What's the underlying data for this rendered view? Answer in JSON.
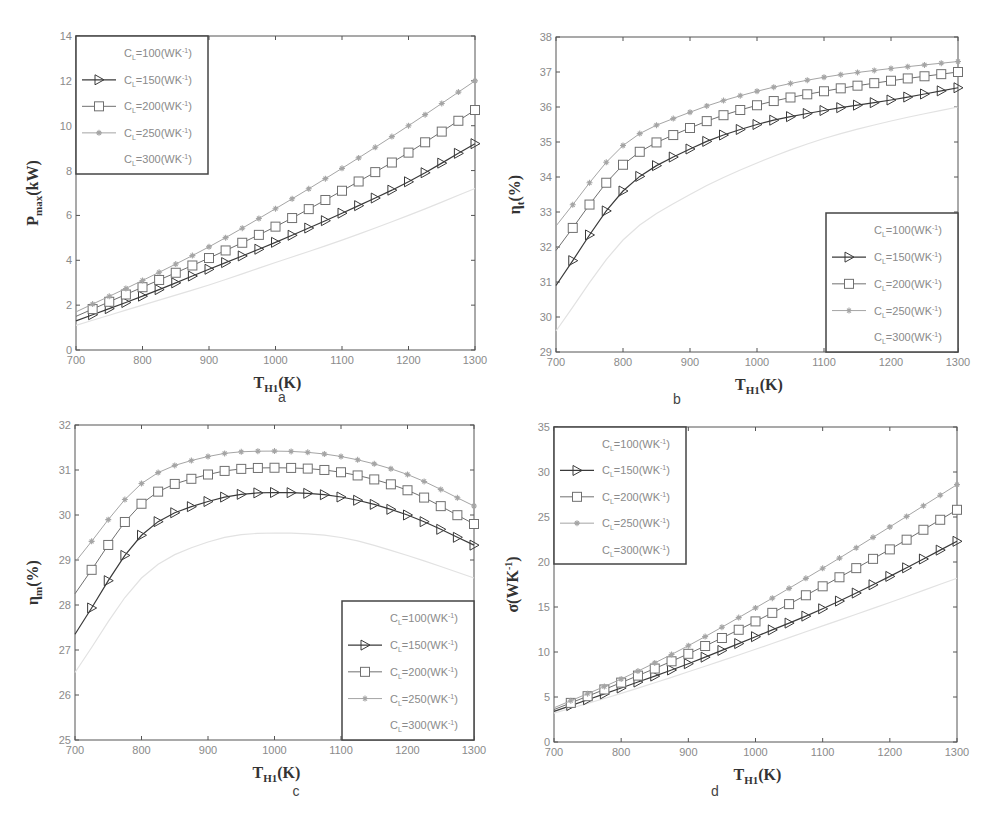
{
  "figure": {
    "panel_labels": [
      "a",
      "b",
      "c",
      "d"
    ],
    "x_label_main": "T",
    "x_label_sub": "H1",
    "x_label_unit": "(K)"
  },
  "legend": {
    "entries": [
      {
        "label": "=100(WK",
        "sup": "-1",
        "close": ")",
        "param": "C",
        "param_sub": "L",
        "marker": "none",
        "color": "#e6e6e6"
      },
      {
        "label": "=150(WK",
        "sup": "-1",
        "close": ")",
        "param": "C",
        "param_sub": "L",
        "marker": "triangle-right",
        "color": "#333333"
      },
      {
        "label": "=200(WK",
        "sup": "-1",
        "close": ")",
        "param": "C",
        "param_sub": "L",
        "marker": "square",
        "color": "#6e6e6e"
      },
      {
        "label": "=250(WK",
        "sup": "-1",
        "close": ")",
        "param": "C",
        "param_sub": "L",
        "marker": "star",
        "color": "#9a9a9a"
      },
      {
        "label": "=300(WK",
        "sup": "-1",
        "close": ")",
        "param": "C",
        "param_sub": "L",
        "marker": "none",
        "color": "#ffffff"
      }
    ]
  },
  "chart_data": [
    {
      "id": "a",
      "type": "line",
      "title": "",
      "xlabel": "T_H1(K)",
      "ylabel": "P_max(kW)",
      "ylabel_main": "P",
      "ylabel_sub": "max",
      "ylabel_unit": "(kW)",
      "x": [
        700,
        800,
        900,
        1000,
        1100,
        1200,
        1300
      ],
      "xlim": [
        700,
        1300
      ],
      "ylim": [
        0,
        14
      ],
      "xticks": [
        700,
        800,
        900,
        1000,
        1100,
        1200,
        1300
      ],
      "yticks": [
        0,
        2,
        4,
        6,
        8,
        10,
        12,
        14
      ],
      "grid": false,
      "legend_position": "upper left",
      "series": [
        {
          "name": "C_L=100(WK^-1)",
          "values": [
            1.1,
            2.0,
            2.9,
            3.9,
            4.9,
            6.0,
            7.2
          ]
        },
        {
          "name": "C_L=150(WK^-1)",
          "values": [
            1.3,
            2.4,
            3.6,
            4.8,
            6.1,
            7.5,
            9.2
          ]
        },
        {
          "name": "C_L=200(WK^-1)",
          "values": [
            1.5,
            2.8,
            4.1,
            5.5,
            7.1,
            8.8,
            10.7
          ]
        },
        {
          "name": "C_L=250(WK^-1)",
          "values": [
            1.7,
            3.1,
            4.6,
            6.3,
            8.1,
            10.0,
            12.0
          ]
        },
        {
          "name": "C_L=300(WK^-1)",
          "values": []
        }
      ]
    },
    {
      "id": "b",
      "type": "line",
      "title": "",
      "xlabel": "T_H1(K)",
      "ylabel": "η_t(%)",
      "ylabel_main": "η",
      "ylabel_sub": "t",
      "ylabel_unit": "(%)",
      "x": [
        700,
        800,
        900,
        1000,
        1100,
        1200,
        1300
      ],
      "xlim": [
        700,
        1300
      ],
      "ylim": [
        29,
        38
      ],
      "xticks": [
        700,
        800,
        900,
        1000,
        1100,
        1200,
        1300
      ],
      "yticks": [
        29,
        30,
        31,
        32,
        33,
        34,
        35,
        36,
        37,
        38
      ],
      "grid": false,
      "legend_position": "lower right",
      "series": [
        {
          "name": "C_L=100(WK^-1)",
          "values": [
            29.6,
            32.2,
            33.5,
            34.4,
            35.1,
            35.6,
            36.0
          ]
        },
        {
          "name": "C_L=150(WK^-1)",
          "values": [
            30.9,
            33.6,
            34.8,
            35.5,
            35.9,
            36.2,
            36.55
          ]
        },
        {
          "name": "C_L=200(WK^-1)",
          "values": [
            31.9,
            34.35,
            35.4,
            36.05,
            36.45,
            36.75,
            37.0
          ]
        },
        {
          "name": "C_L=250(WK^-1)",
          "values": [
            32.6,
            34.9,
            35.85,
            36.45,
            36.85,
            37.1,
            37.3
          ]
        },
        {
          "name": "C_L=300(WK^-1)",
          "values": []
        }
      ]
    },
    {
      "id": "c",
      "type": "line",
      "title": "",
      "xlabel": "T_H1(K)",
      "ylabel": "η_m(%)",
      "ylabel_main": "η",
      "ylabel_sub": "m",
      "ylabel_unit": "(%)",
      "x": [
        700,
        800,
        900,
        1000,
        1100,
        1200,
        1300
      ],
      "xlim": [
        700,
        1300
      ],
      "ylim": [
        25,
        32
      ],
      "xticks": [
        700,
        800,
        900,
        1000,
        1100,
        1200,
        1300
      ],
      "yticks": [
        25,
        26,
        27,
        28,
        29,
        30,
        31,
        32
      ],
      "grid": false,
      "legend_position": "lower right",
      "series": [
        {
          "name": "C_L=100(WK^-1)",
          "values": [
            26.5,
            28.6,
            29.4,
            29.6,
            29.5,
            29.1,
            28.6
          ]
        },
        {
          "name": "C_L=150(WK^-1)",
          "values": [
            27.35,
            29.55,
            30.3,
            30.5,
            30.4,
            30.0,
            29.33
          ]
        },
        {
          "name": "C_L=200(WK^-1)",
          "values": [
            28.25,
            30.25,
            30.9,
            31.05,
            30.95,
            30.55,
            29.8
          ]
        },
        {
          "name": "C_L=250(WK^-1)",
          "values": [
            28.95,
            30.7,
            31.3,
            31.42,
            31.3,
            30.9,
            30.2
          ]
        },
        {
          "name": "C_L=300(WK^-1)",
          "values": []
        }
      ]
    },
    {
      "id": "d",
      "type": "line",
      "title": "",
      "xlabel": "T_H1(K)",
      "ylabel": "σ(WK^-1)",
      "ylabel_main": "σ",
      "ylabel_sub": "",
      "ylabel_unit": "(WK",
      "ylabel_sup": "-1",
      "ylabel_close": ")",
      "x": [
        700,
        800,
        900,
        1000,
        1100,
        1200,
        1300
      ],
      "xlim": [
        700,
        1300
      ],
      "ylim": [
        0,
        35
      ],
      "xticks": [
        700,
        800,
        900,
        1000,
        1100,
        1200,
        1300
      ],
      "yticks": [
        0,
        5,
        10,
        15,
        20,
        25,
        30,
        35
      ],
      "grid": false,
      "legend_position": "upper left",
      "series": [
        {
          "name": "C_L=100(WK^-1)",
          "values": [
            3.2,
            5.4,
            7.8,
            10.3,
            12.9,
            15.5,
            18.2
          ]
        },
        {
          "name": "C_L=150(WK^-1)",
          "values": [
            3.4,
            6.0,
            8.7,
            11.7,
            14.8,
            18.4,
            22.3
          ]
        },
        {
          "name": "C_L=200(WK^-1)",
          "values": [
            3.6,
            6.6,
            9.8,
            13.4,
            17.3,
            21.4,
            25.8
          ]
        },
        {
          "name": "C_L=250(WK^-1)",
          "values": [
            3.8,
            7.0,
            10.7,
            14.9,
            19.3,
            23.9,
            28.6
          ]
        },
        {
          "name": "C_L=300(WK^-1)",
          "values": []
        }
      ]
    }
  ]
}
